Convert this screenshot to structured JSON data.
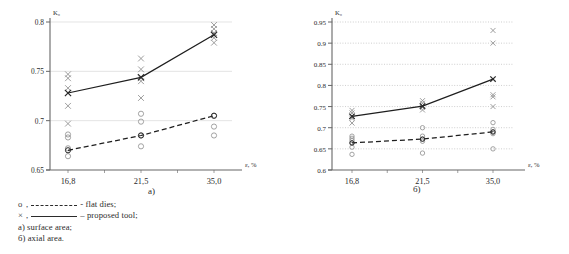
{
  "figure": {
    "caption_a": "a)",
    "caption_b": "б)"
  },
  "legend": {
    "rows": [
      {
        "marker": "o",
        "comma": ",",
        "line": "dashed",
        "text": "- flat dies;"
      },
      {
        "marker": "×",
        "comma": ",",
        "line": "solid",
        "text": "– proposed tool;"
      }
    ],
    "notes": [
      "a) surface area;",
      "б) axial area."
    ]
  },
  "chart_data": [
    {
      "id": "a",
      "type": "line",
      "title": "a)",
      "subtitle": "surface area",
      "xlabel": "ε, %",
      "ylabel": "K₀",
      "categories": [
        "16,8",
        "21,5",
        "35,0"
      ],
      "x": [
        16.8,
        21.5,
        35.0
      ],
      "ylim": [
        0.65,
        0.8
      ],
      "yticks": [
        0.65,
        0.7,
        0.75,
        0.8
      ],
      "ytick_labels": [
        "0.65",
        "0.7",
        "0.75",
        "0.8"
      ],
      "grid": "horizontal-solid-light",
      "legend_position": "below-figure",
      "series": [
        {
          "name": "proposed tool",
          "marker": "×",
          "line": "solid",
          "values": [
            0.728,
            0.744,
            0.787
          ],
          "scatter": [
            [
              0.715,
              0.728,
              0.733,
              0.743,
              0.747,
              0.697
            ],
            [
              0.723,
              0.74,
              0.743,
              0.752,
              0.763
            ],
            [
              0.779,
              0.784,
              0.789,
              0.793,
              0.797
            ]
          ]
        },
        {
          "name": "flat dies",
          "marker": "o",
          "line": "dashed",
          "values": [
            0.67,
            0.685,
            0.705
          ],
          "scatter": [
            [
              0.664,
              0.672,
              0.683,
              0.686
            ],
            [
              0.674,
              0.685,
              0.699,
              0.707
            ],
            [
              0.685,
              0.694,
              0.705
            ]
          ]
        }
      ]
    },
    {
      "id": "b",
      "type": "line",
      "title": "б)",
      "subtitle": "axial area",
      "xlabel": "ε, %",
      "ylabel": "K₀",
      "categories": [
        "16,8",
        "21,5",
        "35,0"
      ],
      "x": [
        16.8,
        21.5,
        35.0
      ],
      "ylim": [
        0.6,
        0.95
      ],
      "yticks": [
        0.6,
        0.65,
        0.7,
        0.75,
        0.8,
        0.85,
        0.9,
        0.95
      ],
      "ytick_labels": [
        "0.6",
        "0.65",
        "0.7",
        "0.75",
        "0.8",
        "0.85",
        "0.9",
        "0.95"
      ],
      "grid": "horizontal-dotted",
      "legend_position": "below-figure",
      "series": [
        {
          "name": "proposed tool",
          "marker": "×",
          "line": "solid",
          "values": [
            0.727,
            0.751,
            0.815
          ],
          "scatter": [
            [
              0.711,
              0.722,
              0.727,
              0.735,
              0.741
            ],
            [
              0.742,
              0.748,
              0.752,
              0.758,
              0.764
            ],
            [
              0.75,
              0.773,
              0.778,
              0.9,
              0.93
            ]
          ]
        },
        {
          "name": "flat dies",
          "marker": "o",
          "line": "dashed",
          "values": [
            0.664,
            0.673,
            0.69
          ],
          "scatter": [
            [
              0.637,
              0.654,
              0.664,
              0.67,
              0.675,
              0.68
            ],
            [
              0.64,
              0.668,
              0.673,
              0.68,
              0.7
            ],
            [
              0.65,
              0.686,
              0.69,
              0.696,
              0.712
            ]
          ]
        }
      ]
    }
  ]
}
